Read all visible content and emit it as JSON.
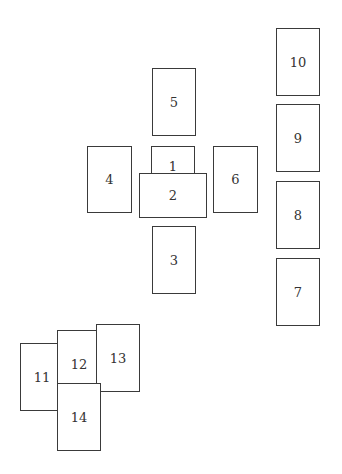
{
  "diagram": {
    "type": "tarot-spread-layout",
    "cards": [
      {
        "label": "1",
        "x": 151,
        "y": 146,
        "w": 44,
        "h": 40,
        "z": 1
      },
      {
        "label": "2",
        "x": 139,
        "y": 173,
        "w": 68,
        "h": 45,
        "z": 2
      },
      {
        "label": "3",
        "x": 152,
        "y": 226,
        "w": 44,
        "h": 68,
        "z": 1
      },
      {
        "label": "4",
        "x": 87,
        "y": 146,
        "w": 45,
        "h": 67,
        "z": 1
      },
      {
        "label": "5",
        "x": 152,
        "y": 68,
        "w": 44,
        "h": 68,
        "z": 1
      },
      {
        "label": "6",
        "x": 213,
        "y": 146,
        "w": 45,
        "h": 67,
        "z": 1
      },
      {
        "label": "7",
        "x": 276,
        "y": 258,
        "w": 44,
        "h": 68,
        "z": 1
      },
      {
        "label": "8",
        "x": 276,
        "y": 181,
        "w": 44,
        "h": 68,
        "z": 1
      },
      {
        "label": "9",
        "x": 276,
        "y": 104,
        "w": 44,
        "h": 68,
        "z": 1
      },
      {
        "label": "10",
        "x": 276,
        "y": 28,
        "w": 44,
        "h": 68,
        "z": 1
      },
      {
        "label": "11",
        "x": 20,
        "y": 343,
        "w": 44,
        "h": 68,
        "z": 1
      },
      {
        "label": "12",
        "x": 57,
        "y": 330,
        "w": 44,
        "h": 68,
        "z": 2
      },
      {
        "label": "13",
        "x": 96,
        "y": 324,
        "w": 44,
        "h": 68,
        "z": 3
      },
      {
        "label": "14",
        "x": 57,
        "y": 383,
        "w": 44,
        "h": 68,
        "z": 4
      }
    ]
  }
}
